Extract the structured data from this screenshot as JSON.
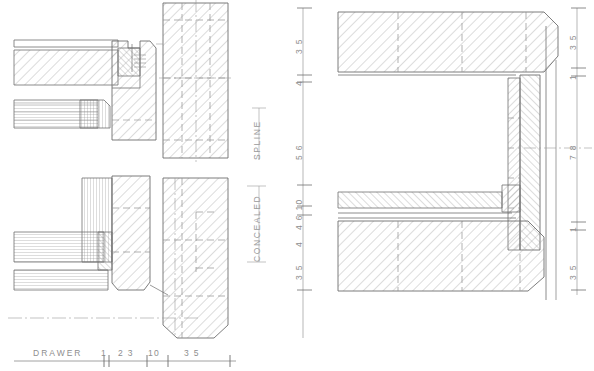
{
  "drawing": {
    "type": "technical-section-drawing",
    "title": "DRAWER",
    "subject": "cabinet drawer joinery cross sections",
    "background_color": "#ffffff",
    "line_color": "#6e6e6e",
    "hatch_color": "#9b9b9b",
    "hidden_line_color": "#8f8f8f",
    "center_line_color": "#9a9a9a",
    "text_color": "#8e8e8e"
  },
  "section_labels": [
    {
      "id": "spline",
      "text": "SPLINE",
      "rotation": -90
    },
    {
      "id": "concealed",
      "text": "CONCEALED",
      "rotation": -90
    }
  ],
  "bottom_scale": {
    "name": "DRAWER",
    "ticks": [
      {
        "label": "1"
      },
      {
        "label": "2 3"
      },
      {
        "label": "10"
      },
      {
        "label": "3 5"
      }
    ]
  },
  "left_dimension_column": {
    "labels": [
      "3 5",
      "4",
      "5 6",
      "4 6 10",
      "4",
      "3 5"
    ]
  },
  "right_dimension_column": {
    "labels": [
      "3 5",
      "1",
      "7 8",
      "1",
      "3 5"
    ]
  },
  "views": [
    {
      "id": "left-view",
      "name": "spline-and-concealed-joint-sections",
      "parts": [
        "horizontal-rail",
        "vertical-post",
        "end-grain-panel",
        "spline-joint"
      ]
    },
    {
      "id": "right-view",
      "name": "drawer-box-corner-section",
      "parts": [
        "top-rail",
        "vertical-stile",
        "bottom-rail",
        "thin-panel",
        "chamfer"
      ]
    }
  ]
}
